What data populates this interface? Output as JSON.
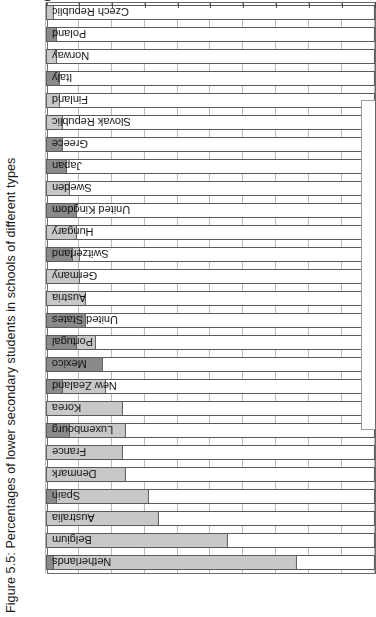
{
  "figure": {
    "title": "Figure 5.5: Percentages of lower secondary students in schools of different types",
    "rotation_note": "chart rendered upside-down (180°)"
  },
  "axis": {
    "ticks": [
      0,
      10,
      20,
      30,
      40,
      50,
      60,
      70,
      80,
      90,
      100
    ],
    "tick_labels": [
      "0",
      "10",
      "20",
      "30",
      "40",
      "50",
      "60",
      "70",
      "80",
      "90",
      "100"
    ],
    "min": 0,
    "max": 100,
    "direction": "100 at left, 0 at right (rotated)"
  },
  "colors": {
    "public": "#ffffff",
    "government_dependent_private": "#c8c8c8",
    "independent_private": "#8a8a8a",
    "outline": "#5a5a5a",
    "grid": "#b9b9b9"
  },
  "chart_data": {
    "type": "bar",
    "title": "Figure 5.5: Percentages of lower secondary students in schools of different types",
    "xlabel": "",
    "ylabel": "",
    "xlim": [
      0,
      100
    ],
    "grid": true,
    "orientation": "horizontal-stacked",
    "legend": [
      "Public",
      "Government-dependent private",
      "Independent private"
    ],
    "legend_position": "none-visible",
    "categories": [
      "Netherlands",
      "Belgium",
      "Australia",
      "Spain",
      "Denmark",
      "France",
      "Luxembourg",
      "Korea",
      "New Zealand",
      "Mexico",
      "Portugal",
      "United States",
      "Austria",
      "Germany",
      "Switzerland",
      "Hungary",
      "United Kingdom",
      "Sweden",
      "Japan",
      "Greece",
      "Slovak Republic",
      "Finland",
      "Italy",
      "Norway",
      "Poland",
      "Czech Republic",
      "Iceland",
      "Ireland"
    ],
    "series": [
      {
        "name": "Public",
        "values": [
          24,
          45,
          66,
          69,
          76,
          77,
          76,
          77,
          82,
          83,
          85,
          88,
          88,
          90,
          90,
          91,
          91,
          93,
          94,
          95,
          95,
          96,
          96,
          97,
          97,
          98,
          99,
          100
        ]
      },
      {
        "name": "Government-dependent private",
        "values": [
          74,
          55,
          34,
          28,
          24,
          23,
          17,
          23,
          13,
          0,
          6,
          0,
          12,
          10,
          2,
          9,
          0,
          7,
          0,
          0,
          5,
          4,
          0,
          3,
          0,
          2,
          0,
          0
        ]
      },
      {
        "name": "Independent private",
        "values": [
          2,
          0,
          0,
          3,
          0,
          0,
          7,
          0,
          5,
          17,
          9,
          12,
          0,
          0,
          8,
          0,
          9,
          0,
          6,
          5,
          0,
          0,
          4,
          0,
          3,
          0,
          1,
          0
        ]
      }
    ]
  }
}
